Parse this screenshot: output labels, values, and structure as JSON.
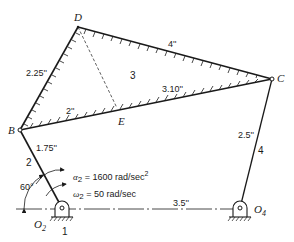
{
  "diagram": {
    "type": "four-bar linkage with ternary coupler",
    "points": {
      "D": {
        "label": "D"
      },
      "C": {
        "label": "C"
      },
      "B": {
        "label": "B"
      },
      "E": {
        "label": "E"
      },
      "O2": {
        "label": "O",
        "sub": "2"
      },
      "O4": {
        "label": "O",
        "sub": "4"
      }
    },
    "links": {
      "ground": {
        "label": "1"
      },
      "crank": {
        "label": "2"
      },
      "coupler": {
        "label": "3"
      },
      "rocker": {
        "label": "4"
      }
    },
    "dimensions": {
      "BD": "2.25''",
      "DC": "4''",
      "BE": "2''",
      "BC": "3.10''",
      "O2B": "1.75''",
      "O4C": "2.5''",
      "O2O4": "3.5''"
    },
    "angle": "60°",
    "alpha": {
      "symbol": "α",
      "sub": "2",
      "text": " = 1600 rad/sec",
      "sup": "2"
    },
    "omega": {
      "symbol": "ω",
      "sub": "2",
      "text": " = 50 rad/sec"
    }
  }
}
